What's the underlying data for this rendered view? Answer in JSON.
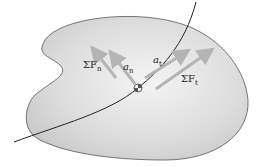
{
  "diagram": {
    "labels": {
      "sum_fn": {
        "sigma": "ΣF",
        "sub": "n"
      },
      "an": {
        "main": "a",
        "sub": "n"
      },
      "at": {
        "main": "a",
        "sub": "t"
      },
      "sum_ft": {
        "sigma": "ΣF",
        "sub": "t"
      }
    },
    "colors": {
      "body_fill_light": "#f2f2f2",
      "body_fill_dark": "#c8c8c8",
      "body_stroke": "#555555",
      "path": "#222222",
      "arrow": "#b4b4b4"
    }
  }
}
